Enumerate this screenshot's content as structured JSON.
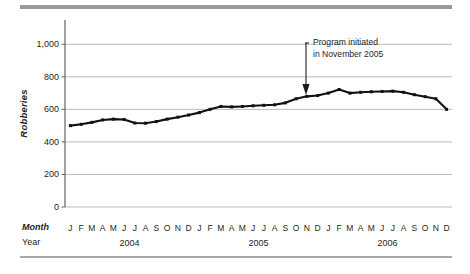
{
  "figure": {
    "ylabel": "Robberies",
    "month_axis_name": "Month",
    "year_axis_name": "Year",
    "annotation_line1": "Program initiated",
    "annotation_line2": "in November 2005",
    "line_color": "#111111",
    "grid_color": "#aaaaaa",
    "axis_color": "#6e6e6e",
    "rule_color": "#9a9a9a"
  },
  "chart_data": {
    "type": "line",
    "title": "",
    "xlabel": "Month / Year",
    "ylabel": "Robberies",
    "ylim": [
      0,
      1100
    ],
    "yticks": [
      0,
      200,
      400,
      600,
      800,
      1000
    ],
    "ytick_labels": [
      "0",
      "200",
      "400",
      "600",
      "800",
      "1,000"
    ],
    "grid": true,
    "legend": "none",
    "months": [
      "J",
      "F",
      "M",
      "A",
      "M",
      "J",
      "J",
      "A",
      "S",
      "O",
      "N",
      "D"
    ],
    "years": [
      "2004",
      "2005",
      "2006"
    ],
    "categories": [
      "Jan 2004",
      "Feb 2004",
      "Mar 2004",
      "Apr 2004",
      "May 2004",
      "Jun 2004",
      "Jul 2004",
      "Aug 2004",
      "Sep 2004",
      "Oct 2004",
      "Nov 2004",
      "Dec 2004",
      "Jan 2005",
      "Feb 2005",
      "Mar 2005",
      "Apr 2005",
      "May 2005",
      "Jun 2005",
      "Jul 2005",
      "Aug 2005",
      "Sep 2005",
      "Oct 2005",
      "Nov 2005",
      "Dec 2005",
      "Jan 2006",
      "Feb 2006",
      "Mar 2006",
      "Apr 2006",
      "May 2006",
      "Jun 2006",
      "Jul 2006",
      "Aug 2006",
      "Sep 2006",
      "Oct 2006",
      "Nov 2006",
      "Dec 2006"
    ],
    "values": [
      500,
      508,
      520,
      535,
      540,
      538,
      516,
      515,
      525,
      540,
      552,
      565,
      580,
      600,
      618,
      615,
      618,
      622,
      625,
      628,
      640,
      665,
      680,
      685,
      700,
      722,
      700,
      705,
      708,
      710,
      712,
      705,
      690,
      678,
      665,
      600
    ],
    "annotations": [
      {
        "text": "Program initiated in November 2005",
        "points_to": "Nov 2005",
        "arrow": "down"
      }
    ]
  }
}
